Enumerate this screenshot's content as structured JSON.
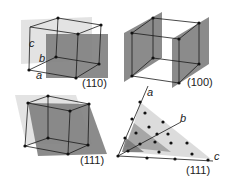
{
  "figure": {
    "panels": [
      {
        "id": "p110",
        "miller": "(110)",
        "axes": {
          "a": "a",
          "b": "b",
          "c": "c"
        }
      },
      {
        "id": "p100",
        "miller": "(100)"
      },
      {
        "id": "p111_cube",
        "miller": "(111)"
      },
      {
        "id": "p111_lattice",
        "miller": "(111)",
        "axes": {
          "a": "a",
          "b": "b",
          "c": "c"
        }
      }
    ],
    "colors": {
      "plane_dark": "#7a7a7a",
      "plane_light": "#d4d4d4",
      "plane_mid": "#a8a8a8",
      "edge": "#1a1a1a",
      "atom": "#111111"
    }
  }
}
